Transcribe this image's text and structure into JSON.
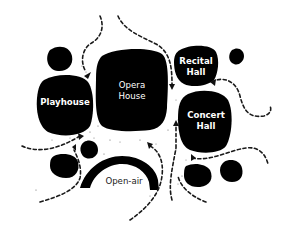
{
  "diagram": {
    "type": "venue-circulation-plan",
    "colors": {
      "building_fill": "#000000",
      "background": "#ffffff",
      "label_on_building": "#ffffff",
      "label_outside": "#222222",
      "path": "#1a1a1a"
    },
    "buildings": [
      {
        "id": "opera-house",
        "line1": "Opera",
        "line2": "House"
      },
      {
        "id": "playhouse",
        "line1": "Playhouse"
      },
      {
        "id": "recital-hall",
        "line1": "Recital",
        "line2": "Hall"
      },
      {
        "id": "concert-hall",
        "line1": "Concert",
        "line2": "Hall"
      },
      {
        "id": "open-air",
        "line1": "Open-air"
      }
    ],
    "legend": {
      "dashed_line": "pedestrian circulation path",
      "small_blob": "unlabeled ancillary structure"
    }
  }
}
